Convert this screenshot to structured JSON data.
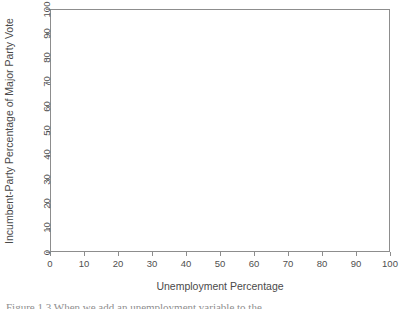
{
  "figure": {
    "background_color": "#ffffff",
    "axis_color": "#8d8d8d",
    "text_color": "#4a4a4a",
    "caption_partial": "Figure 1.3  When we add an unemployment variable to the"
  },
  "chart_data": {
    "type": "scatter",
    "title": "",
    "subtitle": "",
    "xlabel": "Unemployment Percentage",
    "ylabel": "Incumbent-Party Percentage of Major Party Vote",
    "xlim": [
      0,
      100
    ],
    "ylim": [
      0,
      100
    ],
    "xticks": [
      0,
      10,
      20,
      30,
      40,
      50,
      60,
      70,
      80,
      90,
      100
    ],
    "yticks": [
      0,
      10,
      20,
      30,
      40,
      50,
      60,
      70,
      80,
      90,
      100
    ],
    "xticklabels": [
      "0",
      "10",
      "20",
      "30",
      "40",
      "50",
      "60",
      "70",
      "80",
      "90",
      "100"
    ],
    "yticklabels": [
      "0",
      "10",
      "20",
      "30",
      "40",
      "50",
      "60",
      "70",
      "80",
      "90",
      "100"
    ],
    "grid": false,
    "legend": null,
    "annotations": [],
    "series": [
      {
        "name": "observations",
        "x": [],
        "y": []
      }
    ]
  }
}
